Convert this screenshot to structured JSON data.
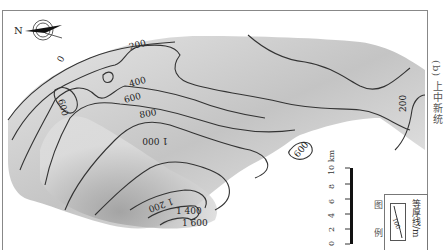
{
  "map": {
    "caption": "(b) 上中新统",
    "north_arrow": {
      "label": "N"
    },
    "contour_labels": [
      {
        "value": "0",
        "x": 62,
        "y": 63
      },
      {
        "value": "200",
        "x": 132,
        "y": 50
      },
      {
        "value": "400",
        "x": 134,
        "y": 87
      },
      {
        "value": "600",
        "x": 125,
        "y": 103
      },
      {
        "value": "800",
        "x": 140,
        "y": 118
      },
      {
        "value": "1 000",
        "x": 146,
        "y": 134
      },
      {
        "value": "600",
        "x": 58,
        "y": 100
      },
      {
        "value": "1 200",
        "x": 160,
        "y": 206
      },
      {
        "value": "1 400",
        "x": 176,
        "y": 212
      },
      {
        "value": "1 600",
        "x": 182,
        "y": 224
      },
      {
        "value": "600",
        "x": 298,
        "y": 150
      },
      {
        "value": "200",
        "x": 410,
        "y": 103
      },
      {
        "value": "400",
        "x": 107,
        "y": 73
      }
    ],
    "scale_bar": {
      "ticks": [
        "0",
        "2",
        "4",
        "6",
        "8",
        "10 km"
      ]
    },
    "legend": {
      "title": "图 例",
      "sample_value": "100",
      "label": "等厚线/m"
    },
    "colors": {
      "contour": "#333333",
      "fill_dark": "#a8a8a8",
      "fill_light": "#e8e8e8",
      "frame": "#888888"
    }
  }
}
